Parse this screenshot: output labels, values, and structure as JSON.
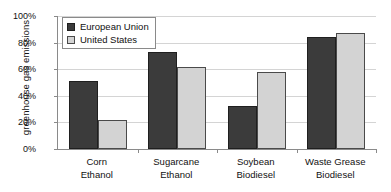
{
  "chart_data": {
    "type": "bar",
    "title": "",
    "subtitle": "",
    "xlabel": "",
    "ylabel": "greenhouse gas emissions",
    "categories": [
      "Corn Ethanol",
      "Sugarcane Ethanol",
      "Soybean Biodiesel",
      "Waste Grease Biodiesel"
    ],
    "category_lines": [
      {
        "line1": "Corn",
        "line2": "Ethanol"
      },
      {
        "line1": "Sugarcane",
        "line2": "Ethanol"
      },
      {
        "line1": "Soybean",
        "line2": "Biodiesel"
      },
      {
        "line1": "Waste Grease",
        "line2": "Biodiesel"
      }
    ],
    "series": [
      {
        "name": "European Union",
        "color": "#3b3b3b",
        "values": [
          51,
          73,
          32,
          84
        ]
      },
      {
        "name": "United States",
        "color": "#d3d3d3",
        "values": [
          22,
          62,
          58,
          87
        ]
      }
    ],
    "ylim": [
      0,
      100
    ],
    "ytick_values": [
      0,
      20,
      40,
      60,
      80,
      100
    ],
    "ytick_labels": [
      "0%",
      "20%",
      "40%",
      "60%",
      "80%",
      "100%"
    ],
    "grid": true,
    "grid_axis": "y",
    "legend_position": "top-left",
    "value_suffix": "%"
  },
  "legend": {
    "items": [
      {
        "label": "European Union",
        "swatch": "dark-gray-square"
      },
      {
        "label": "United States",
        "swatch": "light-gray-square"
      }
    ]
  },
  "colors": {
    "eu_bar": "#3b3b3b",
    "us_bar": "#d3d3d3",
    "axis": "#8a8a8a",
    "gridline": "#d4d4d4",
    "text": "#111111",
    "background": "#ffffff"
  }
}
